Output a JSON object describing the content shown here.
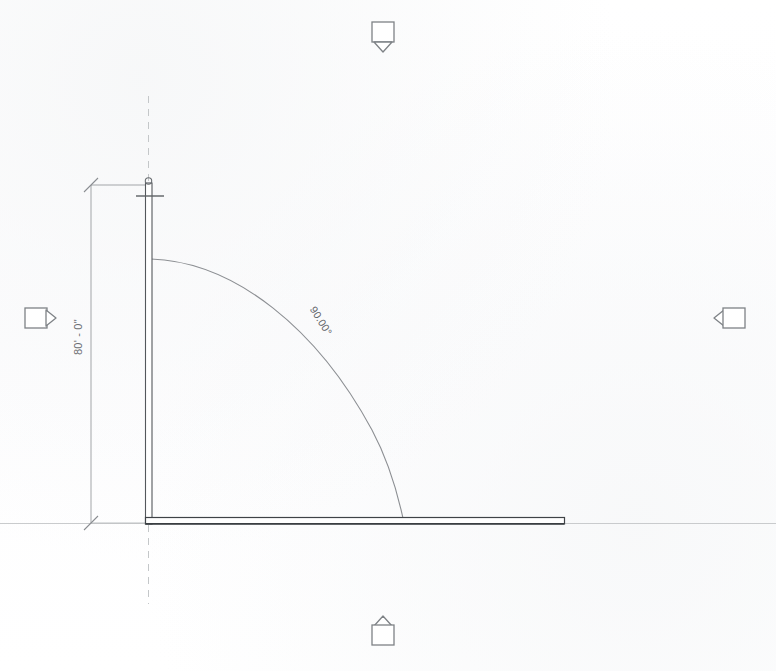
{
  "drawing": {
    "title": "CAD elevation sketch",
    "sheet_background": "#ffffff",
    "line_color": "#6e7276",
    "wall_color": "#4a4d51",
    "reference_color": "#c9cbcd",
    "dimension_color": "#8b8e92"
  },
  "dimensions": {
    "vertical": {
      "label": "80' - 0\"",
      "name": "vertical-linear-dimension"
    },
    "angle": {
      "label": "90.00°",
      "name": "angular-dimension"
    }
  },
  "markers": {
    "top": {
      "name": "elevation-marker-top",
      "direction": "down",
      "label": ""
    },
    "bottom": {
      "name": "elevation-marker-bottom",
      "direction": "up",
      "label": ""
    },
    "left": {
      "name": "elevation-marker-left",
      "direction": "right",
      "label": ""
    },
    "right": {
      "name": "elevation-marker-right",
      "direction": "left",
      "label": ""
    }
  },
  "geometry": {
    "vertical_wall": {
      "name": "vertical-wall",
      "x": 148,
      "y_top": 184,
      "y_bottom": 523,
      "thickness": 7
    },
    "horizontal_wall": {
      "name": "horizontal-wall",
      "y": 523,
      "x_left": 148,
      "x_right": 565,
      "thickness": 7
    },
    "arc": {
      "name": "radius-arc",
      "center_x": 151,
      "center_y": 523,
      "radius": 264
    },
    "grid_line": {
      "name": "grid-reference-line",
      "x": 148,
      "y_top": 96,
      "y_bottom": 604,
      "style": "dashed"
    },
    "dimension_line": {
      "name": "dimension-witness-line",
      "x": 91,
      "y_top": 185,
      "y_bottom": 523
    }
  },
  "ghost_text": {
    "note": "faint illegible scanned-paper show-through",
    "lines": [
      "the reed ribe reee weee ee ee ee reee",
      "and itt teen meee eee ee ee neee ee",
      "ef tern mee ee eee eeee eee ee ee",
      "tee eee weee eeee eee eeee ee",
      "tet eee eeee ee eeeee ee eee",
      "eee eee eeee ee eeee eee eeee",
      "ee eeee ee eeeeee eeee ee ee",
      "eeee eeee ee eeee ee eeeeee",
      "eeee ee eeee eeee eeeee ee"
    ]
  }
}
